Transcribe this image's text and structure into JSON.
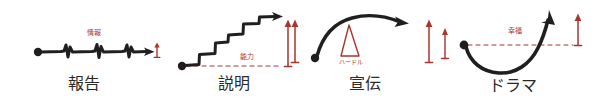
{
  "figure": {
    "title": "",
    "background_color": "#ffffff",
    "ink_color": "#211f1e",
    "accent_color": "#a8352c"
  },
  "panels": [
    {
      "id": "panel-houkoku",
      "caption": "報告",
      "annotation": "情報",
      "annotation_color": "#a8352c",
      "shape": "flat-line-with-spikes",
      "has_dashed_baseline": false,
      "marker_arrow_label": "小さな上向き矢印"
    },
    {
      "id": "panel-setsumei",
      "caption": "説明",
      "annotation": "能力",
      "annotation_color": "#a8352c",
      "shape": "staircase-rising",
      "has_dashed_baseline": true,
      "marker_arrow_label": "大きな上向き矢印"
    },
    {
      "id": "panel-senden",
      "caption": "宣伝",
      "annotation": "ハードル",
      "annotation_color": "#a8352c",
      "shape": "arc-over-hurdle",
      "has_dashed_baseline": false,
      "marker_arrow_label": "大きな上向き矢印"
    },
    {
      "id": "panel-drama",
      "caption": "ドラマ",
      "annotation": "幸福",
      "annotation_color": "#a8352c",
      "shape": "u-curve-rising",
      "has_dashed_baseline": true,
      "marker_arrow_label": "大きな上向き矢印"
    }
  ]
}
